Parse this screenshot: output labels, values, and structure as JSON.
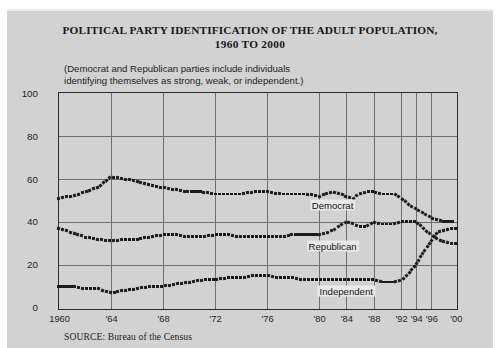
{
  "figure": {
    "title_line1": "POLITICAL PARTY IDENTIFICATION OF THE ADULT POPULATION,",
    "title_line2": "1960 TO 2000",
    "subtitle_line1": "(Democrat and Republican parties include individuals",
    "subtitle_line2": "identifying themselves as strong, weak, or independent.)",
    "source": "SOURCE: Bureau of the Census",
    "colors": {
      "page_background": "#d2d2d2",
      "plot_background": "#d2d2d2",
      "frame": "#2a2a2e",
      "gridline": "#6e6e72",
      "series_marker": "#1b1b1f",
      "label_background": "#e8e8e8",
      "text": "#1d1d22"
    }
  },
  "chart_data": {
    "type": "line",
    "title": "POLITICAL PARTY IDENTIFICATION OF THE ADULT POPULATION, 1960 TO 2000",
    "subtitle": "(Democrat and Republican parties include individuals identifying themselves as strong, weak, or independent.)",
    "xlabel": "",
    "ylabel": "Percent",
    "ylim": [
      0,
      100
    ],
    "yticks": [
      0,
      20,
      40,
      60,
      80,
      100
    ],
    "grid": true,
    "legend_position": "inline-labels",
    "note": "Markers are drawn as short dashed/square segments; x axis uses even-year tick labels with compressed spacing after 1992.",
    "xticks": [
      {
        "label": "1960",
        "year": 1960
      },
      {
        "label": "'64",
        "year": 1964
      },
      {
        "label": "'68",
        "year": 1968
      },
      {
        "label": "'72",
        "year": 1972
      },
      {
        "label": "'76",
        "year": 1976
      },
      {
        "label": "'80",
        "year": 1980
      },
      {
        "label": "'84",
        "year": 1984
      },
      {
        "label": "'88",
        "year": 1988
      },
      {
        "label": "'92",
        "year": 1992
      },
      {
        "label": "'94",
        "year": 1994
      },
      {
        "label": "'96",
        "year": 1996
      },
      {
        "label": "'00",
        "year": 2000
      }
    ],
    "x": [
      1960,
      1961,
      1962,
      1963,
      1964,
      1965,
      1966,
      1967,
      1968,
      1969,
      1970,
      1971,
      1972,
      1973,
      1974,
      1975,
      1976,
      1977,
      1978,
      1979,
      1980,
      1981,
      1982,
      1983,
      1984,
      1985,
      1986,
      1987,
      1988,
      1989,
      1990,
      1991,
      1992,
      1993,
      1994,
      1995,
      1996,
      1997,
      1998,
      1999,
      2000
    ],
    "series": [
      {
        "name": "Democrat",
        "label": "Democrat",
        "values": [
          51,
          52,
          54,
          56,
          61,
          60,
          59,
          57,
          56,
          55,
          54,
          54,
          53,
          53,
          53,
          54,
          54,
          53,
          53,
          53,
          52,
          53,
          54,
          53,
          52,
          51,
          53,
          54,
          54,
          53,
          53,
          53,
          51,
          48,
          46,
          44,
          42,
          41,
          40,
          40,
          40
        ]
      },
      {
        "name": "Republican",
        "label": "Republican",
        "values": [
          37,
          35,
          33,
          32,
          31,
          32,
          32,
          33,
          34,
          34,
          33,
          33,
          34,
          34,
          33,
          33,
          33,
          33,
          34,
          34,
          34,
          35,
          36,
          38,
          40,
          39,
          38,
          38,
          40,
          39,
          39,
          39,
          40,
          40,
          40,
          37,
          34,
          32,
          31,
          30,
          30
        ]
      },
      {
        "name": "Independent",
        "label": "Independent",
        "values": [
          10,
          10,
          9,
          9,
          7,
          8,
          9,
          10,
          10,
          11,
          12,
          13,
          13,
          14,
          14,
          15,
          15,
          14,
          14,
          13,
          13,
          13,
          13,
          13,
          13,
          13,
          13,
          13,
          13,
          12,
          12,
          12,
          13,
          16,
          20,
          26,
          31,
          35,
          36,
          37,
          37
        ]
      }
    ],
    "annotations": [
      {
        "text": "Democrat",
        "at_year": 1982,
        "at_value": 48
      },
      {
        "text": "Republican",
        "at_year": 1982,
        "at_value": 29
      },
      {
        "text": "Independent",
        "at_year": 1984,
        "at_value": 8
      }
    ]
  }
}
